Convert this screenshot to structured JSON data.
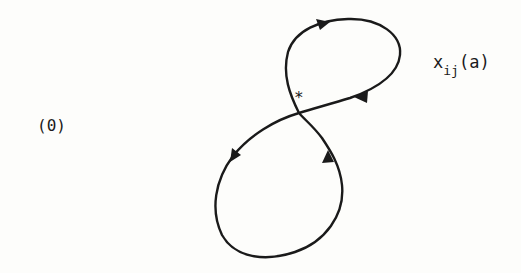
{
  "diagram": {
    "type": "figure-eight-loop",
    "state_label": "(0)",
    "curve_label": {
      "base": "x",
      "subscript": "ij",
      "argument": "(a)"
    },
    "crossing_marker": "*",
    "stroke_color": "#1a1a1a",
    "arrows": [
      {
        "name": "arrow-top-loop-left",
        "direction": "right"
      },
      {
        "name": "arrow-top-loop-return",
        "direction": "left"
      },
      {
        "name": "arrow-bottom-loop-left",
        "direction": "down-left"
      },
      {
        "name": "arrow-bottom-loop-right",
        "direction": "up"
      }
    ]
  }
}
